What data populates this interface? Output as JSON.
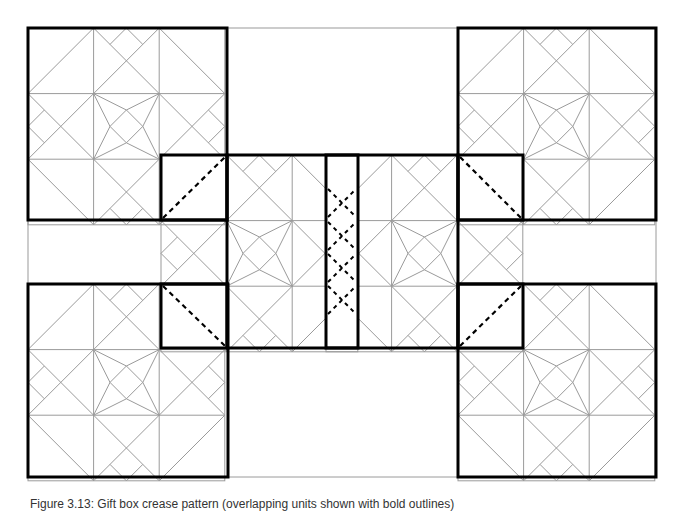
{
  "diagram": {
    "unit_px": 65.6,
    "colors": {
      "thin_line": "#9a9a9a",
      "bold_line": "#000000",
      "dashed_line": "#000000",
      "frame_line": "#9a9a9a",
      "background": "#ffffff"
    },
    "outer_frame": {
      "x": 28,
      "y": 28,
      "w": 628,
      "h": 449
    },
    "pattern_squares": [
      {
        "name": "top-left",
        "x": 28,
        "y": 28
      },
      {
        "name": "top-right",
        "x": 458,
        "y": 28
      },
      {
        "name": "bottom-left",
        "x": 28,
        "y": 284
      },
      {
        "name": "bottom-right",
        "x": 458,
        "y": 284
      },
      {
        "name": "middle-left",
        "x": 161,
        "y": 155
      },
      {
        "name": "middle-right",
        "x": 326,
        "y": 155
      }
    ],
    "bold_squares": [
      {
        "name": "top-left",
        "x": 28,
        "y": 28,
        "w": 199,
        "h": 192
      },
      {
        "name": "top-right",
        "x": 458,
        "y": 28,
        "w": 198,
        "h": 192
      },
      {
        "name": "bottom-left",
        "x": 28,
        "y": 284,
        "w": 200,
        "h": 193
      },
      {
        "name": "bottom-right",
        "x": 458,
        "y": 284,
        "w": 198,
        "h": 193
      },
      {
        "name": "flap-upper-left",
        "x": 161,
        "y": 155,
        "w": 66,
        "h": 65
      },
      {
        "name": "flap-lower-left",
        "x": 161,
        "y": 284,
        "w": 66,
        "h": 64
      },
      {
        "name": "flap-upper-right",
        "x": 458,
        "y": 155,
        "w": 65,
        "h": 65
      },
      {
        "name": "flap-lower-right",
        "x": 458,
        "y": 284,
        "w": 65,
        "h": 64
      },
      {
        "name": "middle-band",
        "x": 227,
        "y": 155,
        "w": 231,
        "h": 193
      },
      {
        "name": "center-strip",
        "x": 326,
        "y": 155,
        "w": 32,
        "h": 193
      }
    ],
    "dashed_lines": [
      {
        "x1": 163,
        "y1": 218,
        "x2": 225,
        "y2": 157
      },
      {
        "x1": 163,
        "y1": 286,
        "x2": 225,
        "y2": 346
      },
      {
        "x1": 460,
        "y1": 157,
        "x2": 521,
        "y2": 218
      },
      {
        "x1": 460,
        "y1": 346,
        "x2": 521,
        "y2": 286
      }
    ],
    "center_x_marks": [
      {
        "cx": 342,
        "cy": 203
      },
      {
        "cx": 342,
        "cy": 236
      },
      {
        "cx": 342,
        "cy": 268
      },
      {
        "cx": 342,
        "cy": 300
      }
    ],
    "caption": "Figure 3.13: Gift box crease pattern (overlapping units shown with bold outlines)"
  }
}
